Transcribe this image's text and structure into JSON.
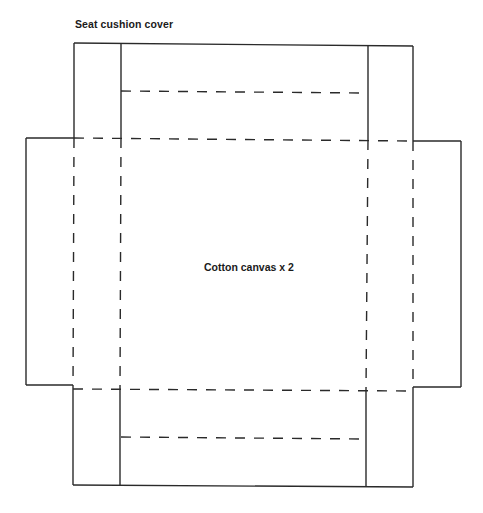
{
  "title": "Seat cushion cover",
  "center_label": "Cotton canvas x 2",
  "colors": {
    "background": "#ffffff",
    "line": "#2a2a2a",
    "text": "#1a1a1a"
  },
  "line_style": {
    "solid_width": 1.4,
    "dash_width": 1.4,
    "dash_pattern": "10 9"
  },
  "pattern": {
    "solid_lines": [
      {
        "name": "top-strip-top-edge",
        "x1": 74,
        "y1": 43,
        "x2": 413,
        "y2": 46
      },
      {
        "name": "top-left-outer-edge",
        "x1": 74,
        "y1": 43,
        "x2": 74,
        "y2": 138
      },
      {
        "name": "top-left-strip-inner-edge",
        "x1": 121,
        "y1": 43,
        "x2": 121,
        "y2": 138
      },
      {
        "name": "top-right-strip-inner-edge",
        "x1": 368,
        "y1": 46,
        "x2": 368,
        "y2": 140
      },
      {
        "name": "top-right-outer-edge",
        "x1": 413,
        "y1": 46,
        "x2": 413,
        "y2": 141
      },
      {
        "name": "left-flap-top-edge",
        "x1": 26,
        "y1": 138,
        "x2": 74,
        "y2": 138
      },
      {
        "name": "left-flap-outer-edge",
        "x1": 26,
        "y1": 138,
        "x2": 26,
        "y2": 385
      },
      {
        "name": "left-flap-bottom-edge",
        "x1": 26,
        "y1": 385,
        "x2": 73,
        "y2": 385
      },
      {
        "name": "right-flap-top-edge",
        "x1": 413,
        "y1": 141,
        "x2": 461,
        "y2": 141
      },
      {
        "name": "right-flap-outer-edge",
        "x1": 461,
        "y1": 141,
        "x2": 461,
        "y2": 387
      },
      {
        "name": "right-flap-bottom-edge",
        "x1": 413,
        "y1": 387,
        "x2": 461,
        "y2": 387
      },
      {
        "name": "bottom-left-outer-edge",
        "x1": 73,
        "y1": 389,
        "x2": 73,
        "y2": 485
      },
      {
        "name": "bottom-left-strip-inner-edge",
        "x1": 120,
        "y1": 389,
        "x2": 120,
        "y2": 485
      },
      {
        "name": "bottom-right-strip-inner-edge",
        "x1": 366,
        "y1": 391,
        "x2": 366,
        "y2": 487
      },
      {
        "name": "bottom-right-outer-edge",
        "x1": 413,
        "y1": 387,
        "x2": 413,
        "y2": 487
      },
      {
        "name": "bottom-strip-bottom-edge",
        "x1": 73,
        "y1": 485,
        "x2": 413,
        "y2": 487
      }
    ],
    "dashed_lines": [
      {
        "name": "top-fold-line",
        "x1": 121,
        "y1": 91,
        "x2": 367,
        "y2": 93
      },
      {
        "name": "upper-seam-line",
        "x1": 74,
        "y1": 138,
        "x2": 413,
        "y2": 141
      },
      {
        "name": "lower-seam-line",
        "x1": 73,
        "y1": 389,
        "x2": 413,
        "y2": 391
      },
      {
        "name": "bottom-fold-line",
        "x1": 121,
        "y1": 437,
        "x2": 366,
        "y2": 439
      },
      {
        "name": "left-outer-seam-line",
        "x1": 74,
        "y1": 138,
        "x2": 73,
        "y2": 389
      },
      {
        "name": "left-inner-seam-line",
        "x1": 121,
        "y1": 138,
        "x2": 120,
        "y2": 389
      },
      {
        "name": "right-inner-seam-line",
        "x1": 368,
        "y1": 140,
        "x2": 366,
        "y2": 391
      },
      {
        "name": "right-outer-seam-line",
        "x1": 413,
        "y1": 141,
        "x2": 413,
        "y2": 387
      }
    ]
  }
}
